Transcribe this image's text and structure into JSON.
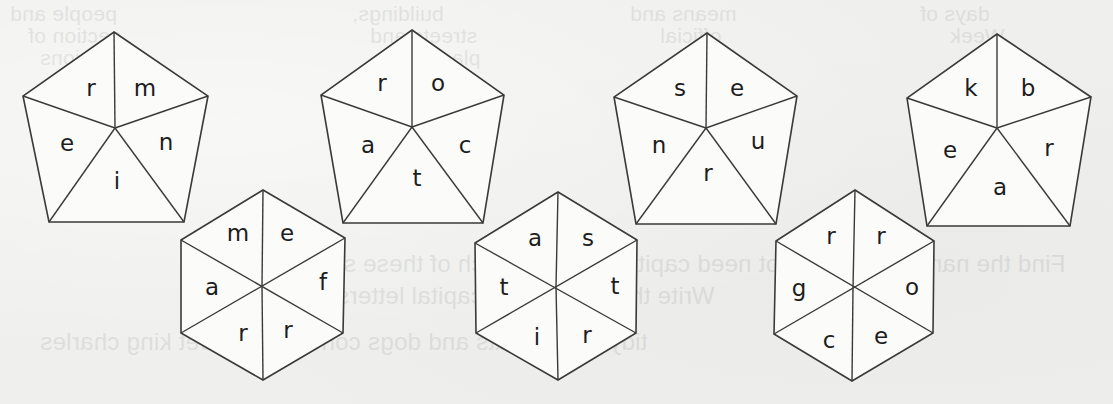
{
  "page": {
    "background": "#efefed",
    "line_color": "#3a3a3a",
    "letter_color": "#1d1d1d"
  },
  "bleed_through": {
    "note": "faint mirrored text from reverse side of page",
    "lines": [
      "people and",
      "section of",
      "fashions",
      "buildings,",
      "streets and",
      "places",
      "means and",
      "official",
      "days of",
      "Week",
      "Find the name that does not need capital letters in each of these se",
      "Write the others with capital letters.",
      "tidy bubble   cats and dogs   concourse    street   king charles"
    ]
  },
  "puzzles": {
    "pentagons": [
      {
        "id": 1,
        "segments": [
          "r",
          "m",
          "n",
          "i",
          "e"
        ]
      },
      {
        "id": 2,
        "segments": [
          "r",
          "o",
          "c",
          "t",
          "a"
        ]
      },
      {
        "id": 3,
        "segments": [
          "s",
          "e",
          "u",
          "r",
          "n"
        ]
      },
      {
        "id": 4,
        "segments": [
          "k",
          "b",
          "r",
          "a",
          "e"
        ]
      }
    ],
    "hexagons": [
      {
        "id": 1,
        "segments": [
          "m",
          "e",
          "f",
          "r",
          "r",
          "a"
        ]
      },
      {
        "id": 2,
        "segments": [
          "a",
          "s",
          "t",
          "r",
          "i",
          "t"
        ]
      },
      {
        "id": 3,
        "segments": [
          "r",
          "r",
          "o",
          "e",
          "c",
          "g"
        ]
      }
    ]
  }
}
